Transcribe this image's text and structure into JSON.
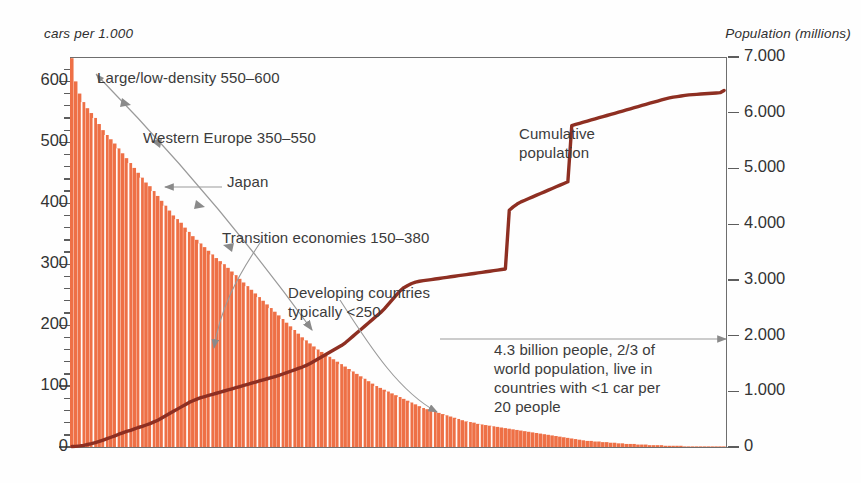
{
  "figure": {
    "left_axis_title": "cars per 1.000",
    "right_axis_title": "Population (millions)"
  },
  "annotations": {
    "large_low_density": "Large/low-density 550–600",
    "western_europe": "Western Europe 350–550",
    "japan": "Japan",
    "transition": "Transition economies 150–380",
    "developing": "Developing countries\ntypically <250",
    "cumulative": "Cumulative\npopulation",
    "four_point_three": "4.3 billion people, 2/3 of\nworld population, live in\ncountries with <1 car per\n20 people"
  },
  "colors": {
    "bars": "#EE7046",
    "bars_edge": "#E9633A",
    "cumulative_line": "#8E2F22",
    "axis": "#6E6E6E",
    "arrow": "#8A8A8A",
    "text": "#3B3B3B"
  },
  "chart_data": {
    "type": "bar",
    "title": "",
    "subtitle": "",
    "xlabel": "",
    "ylabel": "cars per 1.000",
    "y2label": "Population (millions)",
    "grid": false,
    "legend": "none",
    "ylim": [
      0,
      640
    ],
    "y2lim": [
      0,
      7000
    ],
    "left_ticks": [
      0,
      100,
      200,
      300,
      400,
      500,
      600
    ],
    "left_tick_labels": [
      "0",
      "100",
      "200",
      "300",
      "400",
      "500",
      "600"
    ],
    "left_minor_tick_step": 20,
    "right_ticks": [
      0,
      1000,
      2000,
      3000,
      4000,
      5000,
      6000,
      7000
    ],
    "right_tick_labels": [
      "0",
      "1.000",
      "2.000",
      "3.000",
      "4.000",
      "5.000",
      "6.000",
      "7.000"
    ],
    "x_tick_labels": [],
    "series": [
      {
        "name": "Cars per 1.000 people (countries sorted descending)",
        "type": "bar",
        "axis": "left",
        "units": "cars per 1.000 people",
        "values": [
          638,
          600,
          580,
          566,
          556,
          548,
          540,
          530,
          520,
          512,
          505,
          498,
          490,
          482,
          474,
          466,
          458,
          450,
          442,
          434,
          428,
          420,
          412,
          404,
          396,
          388,
          380,
          374,
          368,
          360,
          353,
          346,
          340,
          334,
          328,
          322,
          316,
          310,
          305,
          300,
          294,
          288,
          282,
          276,
          270,
          264,
          258,
          252,
          246,
          240,
          234,
          228,
          222,
          216,
          210,
          204,
          198,
          192,
          186,
          180,
          175,
          170,
          165,
          160,
          156,
          152,
          148,
          144,
          140,
          136,
          132,
          128,
          124,
          120,
          116,
          112,
          108,
          104,
          100,
          97,
          94,
          91,
          88,
          85,
          82,
          79,
          76,
          73,
          70,
          67,
          64,
          62,
          60,
          58,
          56,
          54,
          52,
          50,
          48,
          46,
          44,
          42,
          41,
          40,
          38,
          37,
          36,
          35,
          34,
          33,
          32,
          31,
          30,
          29,
          28,
          27,
          26,
          25,
          24,
          23,
          22,
          21,
          20,
          19,
          18,
          17,
          16,
          15,
          14,
          13,
          12,
          11,
          10,
          10,
          9,
          9,
          8,
          8,
          7,
          7,
          6,
          6,
          5,
          5,
          5,
          4,
          4,
          4,
          3,
          3,
          3,
          3,
          2,
          2,
          2,
          2,
          2,
          1,
          1,
          1,
          1,
          1,
          1,
          1,
          1,
          1,
          1,
          1
        ]
      },
      {
        "name": "Cumulative population",
        "type": "line",
        "axis": "right",
        "units": "millions",
        "values": [
          8,
          12,
          20,
          30,
          45,
          60,
          80,
          100,
          125,
          150,
          175,
          200,
          230,
          255,
          280,
          300,
          325,
          350,
          370,
          395,
          420,
          450,
          480,
          520,
          560,
          600,
          640,
          680,
          720,
          760,
          800,
          830,
          860,
          885,
          905,
          925,
          945,
          965,
          985,
          1005,
          1025,
          1045,
          1065,
          1085,
          1105,
          1125,
          1145,
          1165,
          1185,
          1205,
          1225,
          1245,
          1265,
          1285,
          1310,
          1335,
          1360,
          1385,
          1410,
          1435,
          1465,
          1500,
          1540,
          1580,
          1620,
          1660,
          1700,
          1740,
          1780,
          1820,
          1870,
          1930,
          1990,
          2050,
          2110,
          2170,
          2230,
          2290,
          2350,
          2410,
          2480,
          2560,
          2640,
          2720,
          2800,
          2860,
          2900,
          2935,
          2960,
          2975,
          2985,
          2995,
          3005,
          3015,
          3025,
          3035,
          3045,
          3055,
          3065,
          3075,
          3085,
          3095,
          3105,
          3115,
          3125,
          3135,
          3145,
          3155,
          3165,
          3175,
          3185,
          3195,
          4250,
          4310,
          4360,
          4400,
          4430,
          4460,
          4490,
          4520,
          4550,
          4580,
          4610,
          4640,
          4670,
          4700,
          4730,
          4760,
          5770,
          5790,
          5810,
          5830,
          5850,
          5870,
          5890,
          5910,
          5930,
          5950,
          5970,
          5990,
          6010,
          6030,
          6050,
          6070,
          6090,
          6110,
          6130,
          6150,
          6170,
          6190,
          6210,
          6230,
          6250,
          6265,
          6280,
          6290,
          6300,
          6310,
          6320,
          6325,
          6330,
          6335,
          6340,
          6345,
          6350,
          6355,
          6360,
          6400
        ],
        "notes": "Large vertical jumps correspond to the most populous low-car-ownership countries (India near index 112, China near index 128)."
      }
    ]
  }
}
